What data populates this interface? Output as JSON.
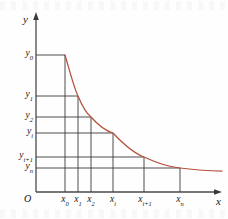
{
  "figure": {
    "title": "",
    "axes": {
      "x_axis_label": "x",
      "y_axis_label": "y",
      "origin_label": "O"
    },
    "curve_color": "#b5503c",
    "line_color": "#3a3a3a",
    "axis_color": "#4a4a4a"
  },
  "chart_data": {
    "type": "line",
    "title": "",
    "xlabel": "x",
    "ylabel": "y",
    "grid": false,
    "legend": "none",
    "xlim": [
      0,
      228
    ],
    "ylim": [
      0,
      219
    ],
    "x_tick_labels": [
      "x₀",
      "x₁",
      "x₂",
      "xᵢ",
      "xᵢ₊₁",
      "xₙ"
    ],
    "y_tick_labels": [
      "y₀",
      "y₁",
      "y₂",
      "yᵢ",
      "yᵢ₊₁",
      "yₙ"
    ],
    "x_ticks": [
      {
        "base": "x",
        "sub": "0",
        "px": 65
      },
      {
        "base": "x",
        "sub": "1",
        "px": 78
      },
      {
        "base": "x",
        "sub": "2",
        "px": 91
      },
      {
        "base": "x",
        "sub": "i",
        "px": 113
      },
      {
        "base": "x",
        "sub": "i+1",
        "px": 144
      },
      {
        "base": "x",
        "sub": "n",
        "px": 180
      }
    ],
    "y_ticks": [
      {
        "base": "y",
        "sub": "0",
        "px": 55
      },
      {
        "base": "y",
        "sub": "1",
        "px": 96
      },
      {
        "base": "y",
        "sub": "2",
        "px": 117
      },
      {
        "base": "y",
        "sub": "i",
        "px": 133
      },
      {
        "base": "y",
        "sub": "i+1",
        "px": 157
      },
      {
        "base": "y",
        "sub": "n",
        "px": 168
      }
    ],
    "curve_points": [
      [
        65,
        55
      ],
      [
        68,
        64
      ],
      [
        71,
        74
      ],
      [
        74,
        83
      ],
      [
        78,
        96
      ],
      [
        82,
        105
      ],
      [
        86,
        112
      ],
      [
        91,
        117
      ],
      [
        97,
        124
      ],
      [
        104,
        129
      ],
      [
        113,
        133
      ],
      [
        123,
        143
      ],
      [
        133,
        151
      ],
      [
        144,
        157
      ],
      [
        155,
        162
      ],
      [
        166,
        166
      ],
      [
        180,
        168
      ],
      [
        195,
        170
      ],
      [
        210,
        171
      ],
      [
        222,
        171
      ]
    ]
  },
  "x_labels": [
    {
      "text": "x",
      "sub": "0",
      "left": 65
    },
    {
      "text": "x",
      "sub": "1",
      "left": 78
    },
    {
      "text": "x",
      "sub": "2",
      "left": 91
    },
    {
      "text": "x",
      "sub": "i",
      "left": 113
    },
    {
      "text": "x",
      "sub": "i+1",
      "left": 144
    },
    {
      "text": "x",
      "sub": "n",
      "left": 180
    }
  ],
  "y_labels": [
    {
      "text": "y",
      "sub": "0",
      "top": 55
    },
    {
      "text": "y",
      "sub": "1",
      "top": 96
    },
    {
      "text": "y",
      "sub": "2",
      "top": 117
    },
    {
      "text": "y",
      "sub": "i",
      "top": 133
    },
    {
      "text": "y",
      "sub": "i+1",
      "top": 157
    },
    {
      "text": "y",
      "sub": "n",
      "top": 168
    }
  ]
}
